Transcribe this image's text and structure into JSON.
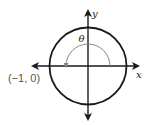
{
  "diagram": {
    "type": "unit-circle",
    "axis_labels": {
      "x": "x",
      "y": "y"
    },
    "angle_label": "θ",
    "point_label": "(−1, 0)",
    "colors": {
      "circle": "#1a1a1a",
      "axes": "#1a1a1a",
      "arc": "#888888",
      "point_text": "#555555"
    }
  }
}
